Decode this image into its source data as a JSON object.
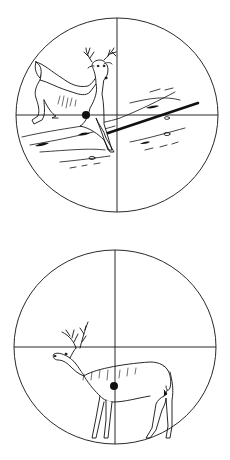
{
  "figure": {
    "colors": {
      "ink": "#111111",
      "background": "#ffffff"
    },
    "panels": [
      {
        "id": "top",
        "label": "Quartering deer in scope",
        "reticle": {
          "cx": 117,
          "cy": 115,
          "rx": 101,
          "ry": 97
        },
        "aim_point": {
          "x": 86,
          "y": 115,
          "r": 4
        }
      },
      {
        "id": "bottom",
        "label": "Broadside deer in scope",
        "reticle": {
          "cx": 115,
          "cy": 347,
          "rx": 101,
          "ry": 97
        },
        "aim_point": {
          "x": 114,
          "y": 386,
          "r": 4
        }
      }
    ]
  }
}
